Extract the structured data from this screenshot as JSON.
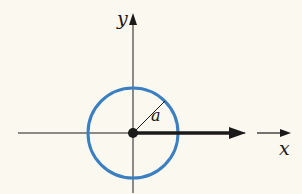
{
  "diagram": {
    "type": "coordinate-plane-circle",
    "axes": {
      "x_label": "x",
      "y_label": "y"
    },
    "circle": {
      "radius_label": "a",
      "stroke_color": "#3a7fc1"
    },
    "colors": {
      "background": "#fbf9ef",
      "axis": "#1a1a1a",
      "circle": "#3a7fc1"
    },
    "elements": [
      "x-axis",
      "y-axis with arrow",
      "circle centered at origin",
      "radius line labeled a",
      "origin point",
      "thick arrow along positive x-axis",
      "direction arrow beside x label"
    ]
  }
}
